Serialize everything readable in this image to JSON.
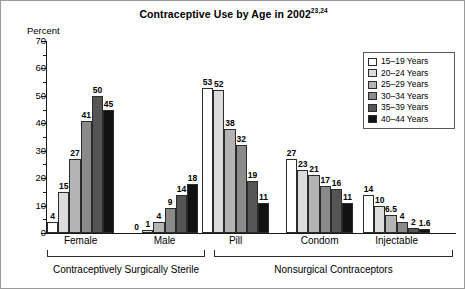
{
  "figure": {
    "title_main": "Contraceptive Use by Age in 2002",
    "title_superscript": "23,24",
    "y_axis_title": "Percent"
  },
  "legend": {
    "items": [
      {
        "label": "15–19 Years",
        "color": "#ffffff"
      },
      {
        "label": "20–24 Years",
        "color": "#dcdcdc"
      },
      {
        "label": "25–29 Years",
        "color": "#b4b4b4"
      },
      {
        "label": "30–34 Years",
        "color": "#8a8a8a"
      },
      {
        "label": "35–39 Years",
        "color": "#555555"
      },
      {
        "label": "40–44 Years",
        "color": "#111111"
      }
    ]
  },
  "brackets": [
    {
      "label": "Contraceptively Surgically Sterile"
    },
    {
      "label": "Nonsurgical Contraceptors"
    }
  ],
  "chart_data": {
    "type": "bar",
    "title": "Contraceptive Use by Age in 2002",
    "xlabel": "",
    "ylabel": "Percent",
    "ylim": [
      0,
      70
    ],
    "ytick_labels": [
      "0",
      "10",
      "20",
      "30",
      "40",
      "50",
      "60",
      "70"
    ],
    "ytick_values": [
      0,
      10,
      20,
      30,
      40,
      50,
      60,
      70
    ],
    "minor_tick_step": 5,
    "grid": false,
    "legend_position": "top-right",
    "categories": [
      "Female",
      "Male",
      "Pill",
      "Condom",
      "Injectable"
    ],
    "series": [
      {
        "name": "15–19 Years",
        "color": "#ffffff",
        "values": [
          4,
          0,
          53,
          27,
          14
        ],
        "labels": [
          "4",
          "0",
          "53",
          "27",
          "14"
        ]
      },
      {
        "name": "20–24 Years",
        "color": "#dcdcdc",
        "values": [
          15,
          1,
          52,
          23,
          10
        ],
        "labels": [
          "15",
          "1",
          "52",
          "23",
          "10"
        ]
      },
      {
        "name": "25–29 Years",
        "color": "#b4b4b4",
        "values": [
          27,
          4,
          38,
          21,
          6.5
        ],
        "labels": [
          "27",
          "4",
          "38",
          "21",
          "6.5"
        ]
      },
      {
        "name": "30–34 Years",
        "color": "#8a8a8a",
        "values": [
          41,
          9,
          32,
          17,
          4
        ],
        "labels": [
          "41",
          "9",
          "32",
          "17",
          "4"
        ]
      },
      {
        "name": "35–39 Years",
        "color": "#555555",
        "values": [
          50,
          14,
          19,
          16,
          2
        ],
        "labels": [
          "50",
          "14",
          "19",
          "16",
          "2"
        ]
      },
      {
        "name": "40–44 Years",
        "color": "#111111",
        "values": [
          45,
          18,
          11,
          11,
          1.6
        ],
        "labels": [
          "45",
          "18",
          "11",
          "11",
          "1.6"
        ]
      }
    ],
    "annotations": [
      {
        "text": "Contraceptively Surgically Sterile",
        "spans": [
          "Female",
          "Male"
        ]
      },
      {
        "text": "Nonsurgical Contraceptors",
        "spans": [
          "Pill",
          "Condom",
          "Injectable"
        ]
      }
    ]
  }
}
